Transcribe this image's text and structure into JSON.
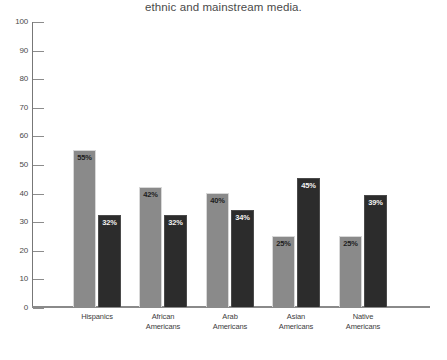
{
  "chart_data": {
    "type": "bar",
    "title": "ethnic and mainstream media.",
    "xlabel": "",
    "ylabel": "",
    "ylim": [
      0,
      100
    ],
    "yticks": [
      0,
      10,
      20,
      30,
      40,
      50,
      60,
      70,
      80,
      90,
      100
    ],
    "grid": false,
    "legend": null,
    "categories": [
      "Hispanics",
      "African Americans",
      "Arab Americans",
      "Asian Americans",
      "Native Americans"
    ],
    "category_lines": [
      [
        "Hispanics"
      ],
      [
        "African",
        "Americans"
      ],
      [
        "Arab",
        "Americans"
      ],
      [
        "Asian",
        "Americans"
      ],
      [
        "Native",
        "Americans"
      ]
    ],
    "series": [
      {
        "name": "light-series",
        "color": "#8a8a8a",
        "values": [
          55,
          42,
          40,
          25,
          25
        ],
        "labels": [
          "55%",
          "42%",
          "40%",
          "25%",
          "25%"
        ]
      },
      {
        "name": "dark-series",
        "color": "#2c2c2c",
        "values": [
          32,
          32,
          34,
          45,
          39
        ],
        "labels": [
          "32%",
          "32%",
          "34%",
          "45%",
          "39%"
        ]
      }
    ]
  },
  "axis": {
    "tick_labels": [
      "100",
      "90",
      "80",
      "70",
      "60",
      "50",
      "40",
      "30",
      "20",
      "10",
      "0"
    ]
  },
  "colors": {
    "light_bar": "#8a8a8a",
    "dark_bar": "#2c2c2c",
    "axis": "#8a8a8a",
    "text": "#3d3d3d",
    "background": "#ffffff"
  }
}
